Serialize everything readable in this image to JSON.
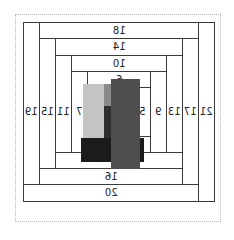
{
  "diagram": {
    "type": "log-cabin-quilt-block",
    "mirrored": true,
    "strips": [
      {
        "id": "s18",
        "label": "18"
      },
      {
        "id": "s14",
        "label": "14"
      },
      {
        "id": "s10",
        "label": "10"
      },
      {
        "id": "s6",
        "label": "6"
      },
      {
        "id": "s12",
        "label": "12"
      },
      {
        "id": "s16",
        "label": "16"
      },
      {
        "id": "s20",
        "label": "20"
      },
      {
        "id": "s19",
        "label": "19"
      },
      {
        "id": "s15",
        "label": "15"
      },
      {
        "id": "s11",
        "label": "11"
      },
      {
        "id": "s7",
        "label": "7"
      },
      {
        "id": "s21",
        "label": "21"
      },
      {
        "id": "s17",
        "label": "17"
      },
      {
        "id": "s13",
        "label": "13"
      },
      {
        "id": "s9",
        "label": "9"
      },
      {
        "id": "s5",
        "label": "5"
      },
      {
        "id": "s8",
        "label": "8"
      }
    ],
    "center_patches": [
      {
        "name": "light-gray-patch",
        "color": "#c4c4c4"
      },
      {
        "name": "mid-gray-patch",
        "color": "#8a8a8a"
      },
      {
        "name": "charcoal-patch",
        "color": "#2e2e2e"
      },
      {
        "name": "black-patch",
        "color": "#1c1c1c"
      },
      {
        "name": "dark-gray-patch",
        "color": "#4e4e4e"
      }
    ]
  }
}
